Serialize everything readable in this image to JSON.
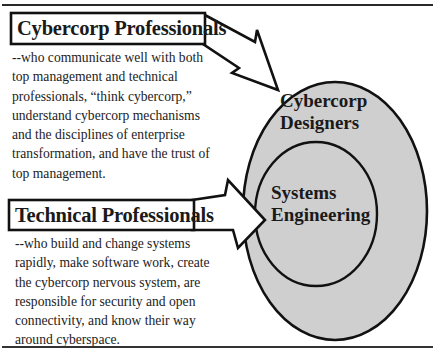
{
  "diagram": {
    "colors": {
      "outer_circle_fill": "#cfcfcf",
      "inner_ellipse_fill": "#cfcfcf",
      "stroke": "#111111",
      "arrow_fill": "#ffffff",
      "background": "#ffffff"
    },
    "top_group": {
      "title": "Cybercorp Professionals",
      "description_lines": [
        "--who communicate well with both",
        "top management and technical",
        "professionals, “think cybercorp,”",
        "understand cybercorp mechanisms",
        "and the disciplines of enterprise",
        "transformation, and have the trust of",
        "top management."
      ]
    },
    "bottom_group": {
      "title": "Technical Professionals",
      "description_lines": [
        "--who build and change systems",
        "rapidly, make software work, create",
        "the cybercorp nervous system, are",
        "responsible for security and open",
        "connectivity, and know their way",
        "around cyberspace."
      ]
    },
    "outer_circle": {
      "label_lines": [
        "Cybercorp",
        "Designers"
      ]
    },
    "inner_circle": {
      "label_lines": [
        "Systems",
        "Engineering"
      ]
    },
    "arrows": [
      {
        "from": "Cybercorp Professionals",
        "to": "Cybercorp Designers"
      },
      {
        "from": "Technical Professionals",
        "to": "Systems Engineering"
      }
    ]
  }
}
